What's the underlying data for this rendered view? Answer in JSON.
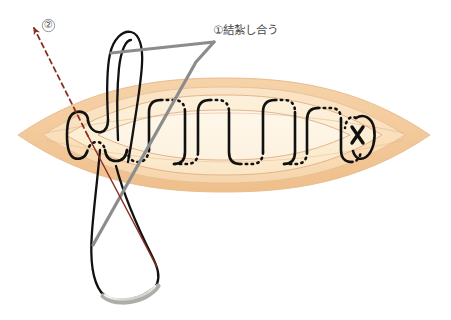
{
  "diagram": {
    "title": "",
    "type": "surgical-suture-illustration",
    "annotations": [
      {
        "id": "ligate",
        "marker": "①",
        "text": "①結紮し合う",
        "x": 213,
        "y": 25,
        "leader_color": "#8c8c8c"
      },
      {
        "id": "direction",
        "marker": "②",
        "text": "②",
        "x": 44,
        "y": 20,
        "arrow_color": "#8b2f22"
      }
    ],
    "wound": {
      "shape": "lens",
      "center_x": 224,
      "center_y": 135,
      "half_width": 206,
      "half_height": 52,
      "layers": [
        {
          "name": "outer-dermis",
          "fill": "#f4cda0",
          "stroke": "#e8bd8c",
          "scale": 1.0
        },
        {
          "name": "mid-dermis",
          "fill": "#fae0bd",
          "stroke": "#e9c49b",
          "scale": 0.88
        },
        {
          "name": "inner-dermis",
          "fill": "#fcecd2",
          "stroke": "#e3b489",
          "scale": 0.72
        },
        {
          "name": "wound-core",
          "fill": "#fdf3e0",
          "stroke": "#d9a87c",
          "scale": 0.5
        }
      ]
    },
    "suture": {
      "color": "#111111",
      "width": 2.6,
      "pattern": "running-subcuticular",
      "solid_means": "suture above tissue",
      "dotted_means": "suture beneath tissue",
      "knot_marker": "×",
      "knot_x": 358,
      "knot_y": 135,
      "loops": 6
    },
    "needle": {
      "color": "#b9b9b4",
      "highlight": "#f2f2ee",
      "x": 100,
      "y": 292
    },
    "colors": {
      "skin_outer": "#f4cda0",
      "skin_mid": "#fae0bd",
      "skin_inner": "#fcecd2",
      "wound_core": "#fdf3e0",
      "suture": "#111111",
      "leader_gray": "#8c8c8c",
      "arrow_red": "#8b2f22",
      "text": "#4a4a4a"
    }
  }
}
